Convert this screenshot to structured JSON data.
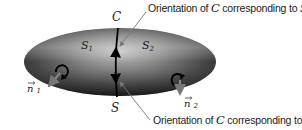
{
  "diagram": {
    "type": "stokes-surface-orientation",
    "surface": {
      "label": "S",
      "fill_dark": "#2a2a2a",
      "fill_light": "#bdbdbd"
    },
    "curve": {
      "label": "C",
      "color": "#000000"
    },
    "regions": [
      {
        "label": "S",
        "sub": "1"
      },
      {
        "label": "S",
        "sub": "2"
      }
    ],
    "normals": [
      {
        "label": "n",
        "sub": "1"
      },
      {
        "label": "n",
        "sub": "2"
      }
    ],
    "annotations": [
      {
        "prefix": "Orientation of ",
        "math": "C",
        "middle": " corresponding to ",
        "target": "S",
        "target_sub": "1"
      },
      {
        "prefix": "Orientation of ",
        "math": "C",
        "middle": " corresponding to ",
        "target": "S",
        "target_sub": "2"
      }
    ],
    "pointer_color": "#777777"
  }
}
